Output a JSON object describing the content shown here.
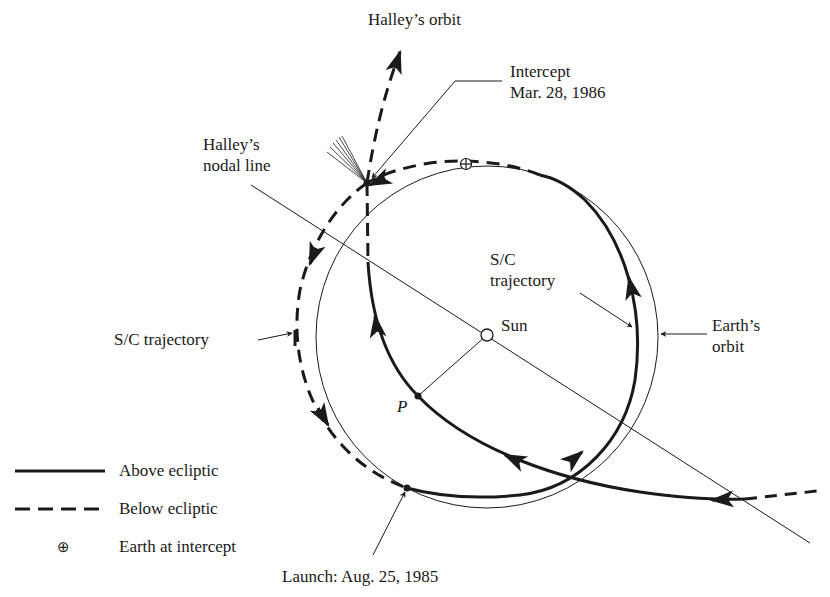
{
  "diagram": {
    "type": "orbital-trajectory",
    "labels": {
      "halleys_orbit": "Halley’s orbit",
      "intercept_line1": "Intercept",
      "intercept_line2": "Mar. 28, 1986",
      "nodal_line_1": "Halley’s",
      "nodal_line_2": "nodal line",
      "sc_trajectory_inner_1": "S/C",
      "sc_trajectory_inner_2": "trajectory",
      "sc_trajectory_outer": "S/C trajectory",
      "sun": "Sun",
      "earths_orbit_1": "Earth’s",
      "earths_orbit_2": "orbit",
      "perihelion": "P",
      "launch": "Launch: Aug. 25, 1985"
    },
    "legend": [
      {
        "symbol": "solid-line",
        "label": "Above ecliptic"
      },
      {
        "symbol": "dashed-line",
        "label": "Below ecliptic"
      },
      {
        "symbol": "earth-symbol",
        "glyph": "⊕",
        "label": "Earth at intercept"
      }
    ],
    "colors": {
      "ink": "#1a1a1a",
      "background": "#ffffff"
    }
  }
}
